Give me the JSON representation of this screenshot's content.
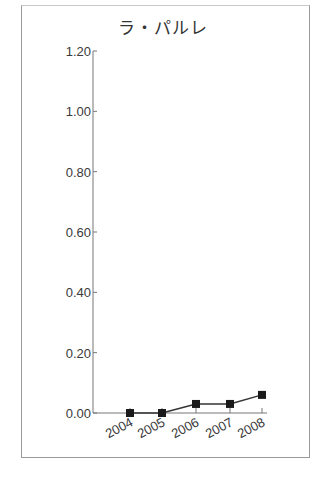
{
  "chart_data": {
    "type": "line",
    "title": "ラ・パルレ",
    "xlabel": "",
    "ylabel": "",
    "categories": [
      "2004",
      "2005",
      "2006",
      "2007",
      "2008"
    ],
    "series": [
      {
        "name": "ラ・パルレ",
        "values": [
          0.0,
          0.0,
          0.03,
          0.03,
          0.06
        ],
        "marker": "square",
        "color": "#1a1a1a"
      }
    ],
    "ylim": [
      0.0,
      1.2
    ],
    "yticks": [
      "0.00",
      "0.20",
      "0.40",
      "0.60",
      "0.80",
      "1.00",
      "1.20"
    ],
    "grid": false,
    "legend": "none"
  }
}
